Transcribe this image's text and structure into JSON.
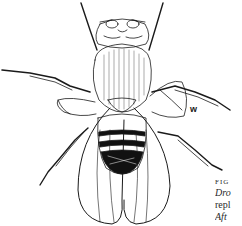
{
  "figure": {
    "annotation_label": "w",
    "colors": {
      "ink": "#1a1a1a",
      "background": "#ffffff",
      "abdomen_dark": "#111111"
    }
  },
  "caption": {
    "line1": "FIG",
    "line2": "Dro",
    "line3": "repl",
    "line4": "Aft"
  }
}
